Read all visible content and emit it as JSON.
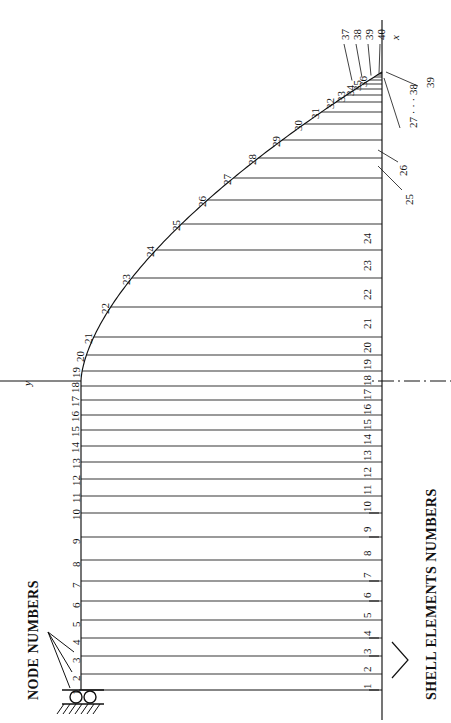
{
  "figure": {
    "type": "finite-element-mesh-diagram",
    "axes": {
      "vertical_label": "x",
      "horizontal_label": "y"
    },
    "annotations": {
      "node_numbers_label": "NODE NUMBERS",
      "shell_elements_label": "SHELL ELEMENTS NUMBERS"
    },
    "support": {
      "kind": "roller-support",
      "rollers": 2,
      "hatching": true
    }
  },
  "node_numbers": {
    "left_wall": [
      "1",
      "2",
      "3",
      "4",
      "5",
      "6",
      "7",
      "8",
      "9",
      "10",
      "11",
      "12",
      "13"
    ],
    "curve": [
      "14",
      "15",
      "16",
      "17",
      "18",
      "19",
      "20",
      "21",
      "22",
      "23",
      "24",
      "25",
      "26",
      "27",
      "28",
      "29",
      "30",
      "31",
      "32",
      "33",
      "34",
      "35",
      "36"
    ],
    "apex_leaders": [
      "37",
      "38",
      "39",
      "40"
    ]
  },
  "element_numbers": {
    "column": [
      "1",
      "2",
      "3",
      "4",
      "5",
      "6",
      "7",
      "8",
      "9",
      "10",
      "11",
      "12",
      "13",
      "14",
      "15",
      "16",
      "17",
      "18",
      "19",
      "20",
      "21",
      "22",
      "23",
      "24"
    ],
    "leader_labels": [
      "25",
      "26"
    ],
    "apex_group": "27 · · · 38",
    "apex_last": "39"
  },
  "geometry": {
    "left_wall_x": 81,
    "right_axis_x": 382,
    "base_y": 690,
    "apex_y": 72,
    "centerline_y": 381,
    "element_rows": [
      674,
      656,
      638,
      620,
      601,
      581,
      560,
      537,
      513,
      496,
      479,
      462,
      446,
      430,
      415,
      400,
      386,
      371,
      355,
      337,
      307,
      278,
      250,
      224,
      200,
      178,
      158,
      140,
      124,
      112,
      102,
      95,
      89,
      84,
      80,
      77,
      75,
      73.5,
      72.5
    ],
    "curve_start_y": 381,
    "curve_start_x": 81
  }
}
